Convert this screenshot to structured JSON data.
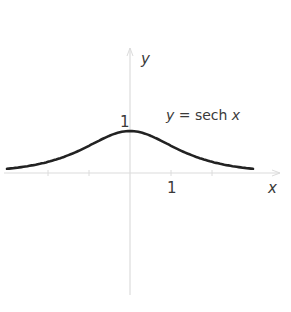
{
  "chart_data": {
    "type": "line",
    "title": "",
    "function": "y = sech x",
    "xlabel": "x",
    "ylabel": "y",
    "annotation": "y = sech x",
    "tick_labels": {
      "x": [
        "1"
      ],
      "y": [
        "1"
      ]
    },
    "xlim": [
      -3.0,
      3.0
    ],
    "ylim": [
      -2.9,
      2.7
    ],
    "grid": false,
    "series": [
      {
        "name": "sech x",
        "x": [
          -3.0,
          -2.5,
          -2.0,
          -1.5,
          -1.0,
          -0.5,
          0.0,
          0.5,
          1.0,
          1.5,
          2.0,
          2.5,
          3.0
        ],
        "values": [
          0.099,
          0.163,
          0.266,
          0.425,
          0.648,
          0.887,
          1.0,
          0.887,
          0.648,
          0.425,
          0.266,
          0.163,
          0.099
        ]
      }
    ]
  },
  "labels": {
    "x_axis": "x",
    "y_axis": "y",
    "x_tick_one": "1",
    "y_tick_one": "1",
    "equation_y": "y",
    "equation_rest": " = sech ",
    "equation_x": "x"
  },
  "colors": {
    "curve": "#222222",
    "axes": "#d8d8d8",
    "text": "#3a3a3a"
  }
}
